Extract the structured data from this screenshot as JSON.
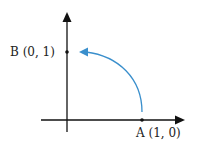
{
  "diagram": {
    "type": "coordinate-rotation",
    "points": [
      {
        "id": "A",
        "label": "A (1,  0)",
        "x": 1,
        "y": 0
      },
      {
        "id": "B",
        "label": "B (0,  1)",
        "x": 0,
        "y": 1
      }
    ],
    "arc": {
      "from": "A",
      "to": "B",
      "direction": "counterclockwise",
      "color": "#3a8fcc"
    },
    "axis_color": "#111111"
  }
}
